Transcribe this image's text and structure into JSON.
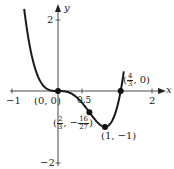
{
  "chart_data": {
    "type": "line",
    "title": "",
    "function": "y = 3x^4 - 4x^3",
    "xlabel": "x",
    "ylabel": "y",
    "xlim": [
      -1,
      2
    ],
    "ylim": [
      -2,
      2
    ],
    "x_ticks": [
      -1,
      0.5,
      2
    ],
    "x_tick_labels": [
      "−1",
      "0.5",
      "2"
    ],
    "y_ticks": [
      2,
      -2
    ],
    "y_tick_labels": [
      "2",
      "−2"
    ],
    "grid": false,
    "legend": null,
    "series": [
      {
        "name": "curve",
        "x": [
          -0.75,
          -0.5,
          -0.25,
          0,
          0.25,
          0.5,
          0.667,
          0.75,
          1,
          1.25,
          1.333,
          1.4
        ],
        "y": [
          2.64,
          0.69,
          0.07,
          0,
          -0.05,
          -0.31,
          -0.59,
          -0.74,
          -1,
          -0.08,
          0,
          0.72
        ]
      }
    ],
    "points": [
      {
        "x": 0,
        "y": 0,
        "label": "(0, 0)"
      },
      {
        "x": 0.667,
        "y": -0.593,
        "label": "(2/3, −16/27)"
      },
      {
        "x": 1,
        "y": -1,
        "label": "(1, −1)"
      },
      {
        "x": 1.333,
        "y": 0,
        "label": "(4/3, 0)"
      }
    ]
  },
  "labels": {
    "x_axis": "x",
    "y_axis": "y",
    "tick_neg1": "−1",
    "tick_half": "0.5",
    "tick_2x": "2",
    "tick_2y": "2",
    "tick_neg2y": "−2",
    "pt_origin": "(0, 0)",
    "pt_min": "(1, −1)",
    "pt_root_open": "(",
    "pt_root_num": "4",
    "pt_root_den": "3",
    "pt_root_close": ", 0)",
    "pt_infl_open": "(",
    "pt_infl_xnum": "2",
    "pt_infl_xden": "3",
    "pt_infl_sep": ", −",
    "pt_infl_ynum": "16",
    "pt_infl_yden": "27",
    "pt_infl_close": ")"
  }
}
